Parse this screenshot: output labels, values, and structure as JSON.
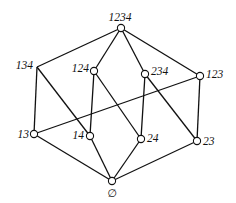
{
  "diagram": {
    "type": "hasse-diagram",
    "nodes": [
      {
        "id": "1234",
        "label": "1234",
        "x": 121,
        "y": 28,
        "circle": true,
        "lx": 120,
        "ly": 21,
        "anchor": "middle"
      },
      {
        "id": "134",
        "label": "134",
        "x": 37,
        "y": 67,
        "circle": false,
        "lx": 33,
        "ly": 69,
        "anchor": "end"
      },
      {
        "id": "124",
        "label": "124",
        "x": 94,
        "y": 71,
        "circle": true,
        "lx": 89,
        "ly": 72,
        "anchor": "end"
      },
      {
        "id": "234",
        "label": "234",
        "x": 145,
        "y": 74,
        "circle": true,
        "lx": 151,
        "ly": 75,
        "anchor": "start"
      },
      {
        "id": "123",
        "label": "123",
        "x": 200,
        "y": 76,
        "circle": true,
        "lx": 206,
        "ly": 78,
        "anchor": "start"
      },
      {
        "id": "13",
        "label": "13",
        "x": 34,
        "y": 134,
        "circle": true,
        "lx": 29,
        "ly": 138,
        "anchor": "end"
      },
      {
        "id": "14",
        "label": "14",
        "x": 90,
        "y": 136,
        "circle": true,
        "lx": 84,
        "ly": 139,
        "anchor": "end"
      },
      {
        "id": "24",
        "label": "24",
        "x": 141,
        "y": 139,
        "circle": true,
        "lx": 147,
        "ly": 142,
        "anchor": "start"
      },
      {
        "id": "23",
        "label": "23",
        "x": 197,
        "y": 141,
        "circle": true,
        "lx": 203,
        "ly": 145,
        "anchor": "start"
      },
      {
        "id": "empty",
        "label": "∅",
        "x": 112,
        "y": 181,
        "circle": true,
        "lx": 112,
        "ly": 197,
        "anchor": "middle"
      }
    ],
    "edges": [
      [
        "1234",
        "134"
      ],
      [
        "1234",
        "124"
      ],
      [
        "1234",
        "234"
      ],
      [
        "1234",
        "123"
      ],
      [
        "134",
        "13"
      ],
      [
        "134",
        "14"
      ],
      [
        "124",
        "14"
      ],
      [
        "124",
        "24"
      ],
      [
        "234",
        "24"
      ],
      [
        "234",
        "23"
      ],
      [
        "123",
        "13"
      ],
      [
        "123",
        "23"
      ],
      [
        "13",
        "empty"
      ],
      [
        "14",
        "empty"
      ],
      [
        "24",
        "empty"
      ],
      [
        "23",
        "empty"
      ]
    ],
    "colors": {
      "line": "#111111",
      "node_fill": "#ffffff",
      "background": "#ffffff"
    }
  }
}
